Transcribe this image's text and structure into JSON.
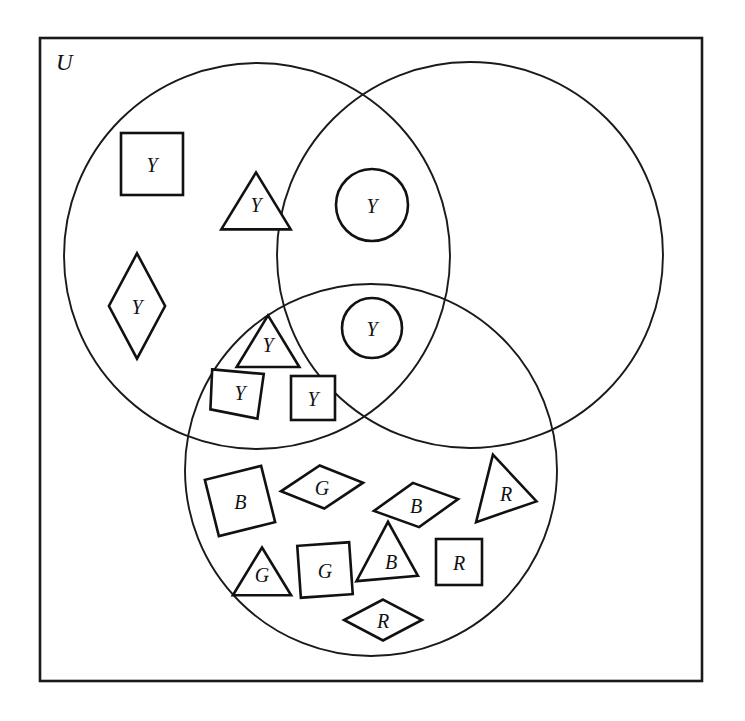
{
  "figure": {
    "type": "venn-diagram",
    "background_color": "#ffffff",
    "line_color": "#1a1a1a",
    "shape_fill": "#ffffff",
    "universe_label": "U",
    "width": 745,
    "height": 721
  },
  "universe": {
    "name": "universal-set-rectangle",
    "x": 40,
    "y": 38,
    "width": 662,
    "height": 643,
    "label": "U",
    "label_x": 56,
    "label_y": 62
  },
  "circles": [
    {
      "name": "left-circle",
      "cx": 257,
      "cy": 256,
      "r": 193
    },
    {
      "name": "right-circle",
      "cx": 470,
      "cy": 255,
      "r": 193
    },
    {
      "name": "bottom-circle",
      "cx": 371,
      "cy": 470,
      "r": 186
    }
  ],
  "shapes": [
    {
      "id": "sq-y-1",
      "form": "square",
      "label": "Y",
      "cx": 152,
      "cy": 164,
      "size": 62,
      "rotation": 0,
      "region": "left-only"
    },
    {
      "id": "tri-y-1",
      "form": "triangle",
      "label": "Y",
      "cx": 256,
      "cy": 204,
      "size": 62,
      "rotation": 0,
      "region": "left-only"
    },
    {
      "id": "cir-y-1",
      "form": "circle",
      "label": "Y",
      "cx": 372,
      "cy": 205,
      "size": 72,
      "rotation": 0,
      "region": "left-right"
    },
    {
      "id": "dia-y-1",
      "form": "diamond-tall",
      "label": "Y",
      "cx": 137,
      "cy": 306,
      "size": 78,
      "rotation": 0,
      "region": "left-only"
    },
    {
      "id": "cir-y-2",
      "form": "circle",
      "label": "Y",
      "cx": 372,
      "cy": 328,
      "size": 60,
      "rotation": 0,
      "region": "triple"
    },
    {
      "id": "tri-y-2",
      "form": "triangle",
      "label": "Y",
      "cx": 268,
      "cy": 344,
      "size": 56,
      "rotation": 0,
      "region": "left-bottom"
    },
    {
      "id": "par-y-1",
      "form": "parallelogram",
      "label": "Y",
      "cx": 240,
      "cy": 392,
      "size": 58,
      "rotation": 0,
      "region": "left-bottom"
    },
    {
      "id": "sq-y-2",
      "form": "square",
      "label": "Y",
      "cx": 313,
      "cy": 398,
      "size": 44,
      "rotation": 0,
      "region": "left-bottom"
    },
    {
      "id": "sq-b-1",
      "form": "square",
      "label": "B",
      "cx": 240,
      "cy": 501,
      "size": 58,
      "rotation": -14,
      "region": "bottom-only"
    },
    {
      "id": "dia-g-1",
      "form": "diamond-wide",
      "label": "G",
      "cx": 322,
      "cy": 487,
      "size": 70,
      "rotation": -6,
      "region": "bottom-only"
    },
    {
      "id": "dia-b-1",
      "form": "diamond-wide",
      "label": "B",
      "cx": 416,
      "cy": 505,
      "size": 72,
      "rotation": -8,
      "region": "bottom-only"
    },
    {
      "id": "tri-r-1",
      "form": "triangle-rot",
      "label": "R",
      "cx": 507,
      "cy": 494,
      "size": 58,
      "rotation": 104,
      "region": "bottom-only"
    },
    {
      "id": "tri-g-1",
      "form": "triangle",
      "label": "G",
      "cx": 262,
      "cy": 574,
      "size": 52,
      "rotation": 0,
      "region": "bottom-only"
    },
    {
      "id": "sq-g-1",
      "form": "square",
      "label": "G",
      "cx": 325,
      "cy": 570,
      "size": 52,
      "rotation": -4,
      "region": "bottom-only"
    },
    {
      "id": "tri-b-1",
      "form": "triangle-rot",
      "label": "B",
      "cx": 392,
      "cy": 562,
      "size": 56,
      "rotation": 118,
      "region": "bottom-only"
    },
    {
      "id": "sq-r-1",
      "form": "square",
      "label": "R",
      "cx": 459,
      "cy": 562,
      "size": 46,
      "rotation": 0,
      "region": "bottom-only"
    },
    {
      "id": "dia-r-1",
      "form": "diamond-wide",
      "label": "R",
      "cx": 383,
      "cy": 620,
      "size": 66,
      "rotation": 0,
      "region": "bottom-only"
    }
  ],
  "chart_data": {
    "type": "diagram",
    "title": "",
    "legend_position": "none",
    "regions": [
      {
        "name": "left-only",
        "members": [
          "square Y",
          "triangle Y",
          "diamond Y"
        ]
      },
      {
        "name": "left-right",
        "members": [
          "circle Y"
        ]
      },
      {
        "name": "triple",
        "members": [
          "circle Y"
        ]
      },
      {
        "name": "left-bottom",
        "members": [
          "triangle Y",
          "parallelogram Y",
          "square Y"
        ]
      },
      {
        "name": "right-only",
        "members": []
      },
      {
        "name": "right-bottom",
        "members": []
      },
      {
        "name": "bottom-only",
        "members": [
          "square B",
          "diamond G",
          "diamond B",
          "triangle R",
          "triangle G",
          "square G",
          "triangle B",
          "square R",
          "diamond R"
        ]
      },
      {
        "name": "outside",
        "members": []
      }
    ],
    "label_counts": {
      "Y": 8,
      "B": 3,
      "G": 3,
      "R": 3
    }
  }
}
